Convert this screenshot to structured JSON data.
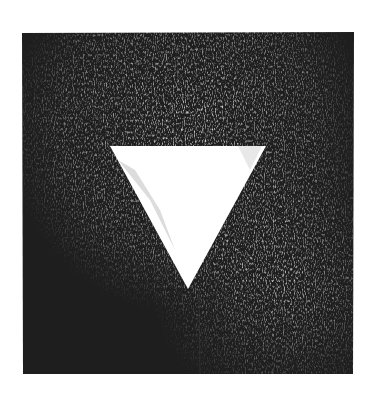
{
  "artwork": {
    "description": "Monochrome textured print: dark square with white inverted triangle",
    "background": "#ffffff",
    "square": {
      "x": 22,
      "y": 32,
      "w": 332,
      "h": 342,
      "color": "#1e1e1e"
    },
    "triangle": {
      "points": "110,146 266,146 188,289",
      "color": "#ffffff"
    },
    "texture_color": "#d8d8d8"
  }
}
